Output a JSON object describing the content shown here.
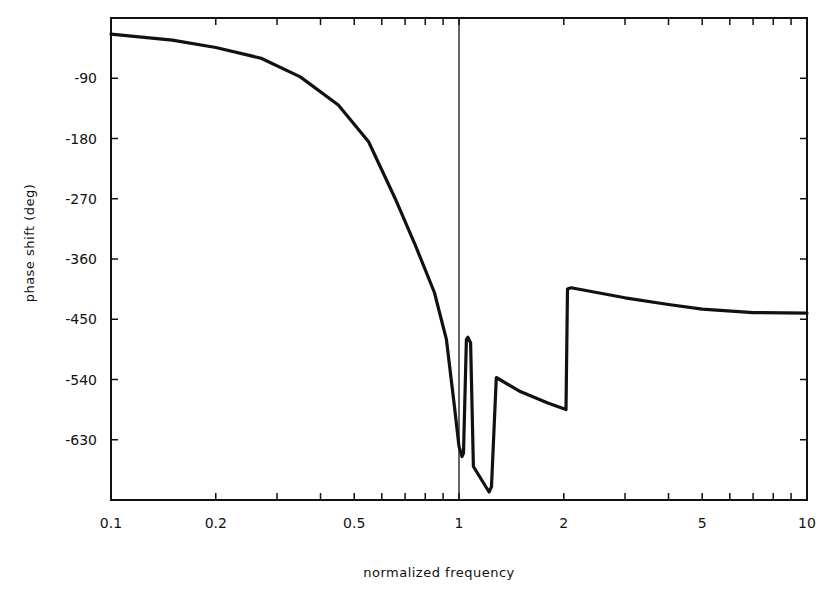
{
  "chart_data": {
    "type": "line",
    "title": "",
    "xlabel": "normalized frequency",
    "ylabel": "phase shift (deg)",
    "xscale": "log",
    "xlim": [
      0.1,
      10
    ],
    "ylim": [
      -720,
      0
    ],
    "grid": false,
    "legend": null,
    "x_ticks": [
      0.1,
      0.2,
      0.5,
      1,
      2,
      5,
      10
    ],
    "x_tick_labels": [
      "0.1",
      "0.2",
      "0.5",
      "1",
      "2",
      "5",
      "10"
    ],
    "y_ticks": [
      -90,
      -180,
      -270,
      -360,
      -450,
      -540,
      -630
    ],
    "y_tick_labels": [
      "-90",
      "-180",
      "-270",
      "-360",
      "-450",
      "-540",
      "-630"
    ],
    "annotations": [
      {
        "type": "vertical_line",
        "x": 1
      }
    ],
    "series": [
      {
        "name": "phase",
        "color": "#111111",
        "x": [
          0.1,
          0.15,
          0.2,
          0.27,
          0.35,
          0.45,
          0.55,
          0.66,
          0.75,
          0.85,
          0.92,
          0.97,
          1.0,
          1.02,
          1.03,
          1.05,
          1.06,
          1.08,
          1.1,
          1.22,
          1.24,
          1.28,
          1.5,
          1.8,
          2.03,
          2.05,
          2.1,
          3,
          4,
          5,
          7,
          10
        ],
        "y": [
          -24,
          -33,
          -44,
          -60,
          -88,
          -130,
          -185,
          -273,
          -340,
          -410,
          -480,
          -580,
          -640,
          -655,
          -650,
          -480,
          -477,
          -485,
          -670,
          -708,
          -700,
          -537,
          -558,
          -575,
          -585,
          -405,
          -403,
          -418,
          -428,
          -435,
          -440,
          -441
        ]
      }
    ]
  }
}
